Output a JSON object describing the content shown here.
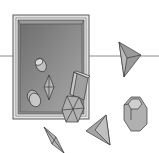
{
  "scene": {
    "description": "Grayscale illustration of a framed dark panel crossed by a horizontal line, with assorted crystal/polyhedron shapes inside and outside the frame",
    "colors": {
      "background": "#ffffff",
      "frame_outer": "#d8d8d8",
      "frame_panel": "#7a7a7a",
      "panel_highlight": "#9a9a9a",
      "shape_fill": "#a8a8a8",
      "shape_light": "#c4c4c4",
      "stroke": "#3a3a3a",
      "line": "#8a8a8a"
    },
    "objects": [
      {
        "name": "frame",
        "type": "rectangle-frame"
      },
      {
        "name": "horizontal-line",
        "type": "line"
      },
      {
        "name": "cylinder-small",
        "type": "cylinder"
      },
      {
        "name": "bipyramid-inside",
        "type": "bipyramid"
      },
      {
        "name": "disc-double",
        "type": "disc"
      },
      {
        "name": "prism-tilted",
        "type": "prism"
      },
      {
        "name": "hexagonal-prism",
        "type": "hexagon"
      },
      {
        "name": "tetrahedron-right",
        "type": "tetrahedron"
      },
      {
        "name": "octagonal-prism",
        "type": "octagonal-prism"
      },
      {
        "name": "bipyramid-bottom",
        "type": "bipyramid"
      },
      {
        "name": "tetrahedron-bottom",
        "type": "tetrahedron"
      }
    ]
  }
}
